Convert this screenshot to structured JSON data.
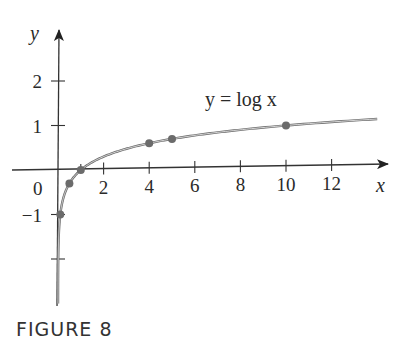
{
  "chart_data": {
    "type": "line",
    "title": "",
    "caption": "FIGURE 8",
    "xlabel": "x",
    "ylabel": "y",
    "equation_label": "y = log x",
    "xlim": [
      -2,
      14.5
    ],
    "ylim": [
      -3,
      2.9
    ],
    "grid": false,
    "x_ticks": [
      2,
      4,
      6,
      8,
      10,
      12
    ],
    "x_tick_labels": [
      "2",
      "4",
      "6",
      "8",
      "10",
      "12"
    ],
    "y_ticks": [
      -2,
      -1,
      1,
      2
    ],
    "y_tick_labels": [
      "",
      "−1",
      "1",
      "2"
    ],
    "origin_label": "0",
    "series": [
      {
        "name": "y = log x",
        "function": "log10(x)",
        "x_range": [
          0.0013,
          14
        ],
        "color": "#6b6b6b"
      }
    ],
    "points": [
      {
        "x": 0.1,
        "y": -1
      },
      {
        "x": 0.5,
        "y": -0.301
      },
      {
        "x": 1,
        "y": 0
      },
      {
        "x": 4,
        "y": 0.602
      },
      {
        "x": 5,
        "y": 0.699
      },
      {
        "x": 10,
        "y": 1
      }
    ],
    "colors": {
      "axis": "#333333",
      "curve": "#6b6b6b",
      "points": "#6b6b6b"
    }
  }
}
